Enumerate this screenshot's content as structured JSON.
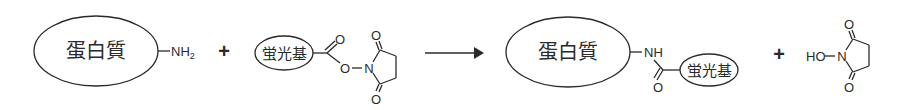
{
  "diagram": {
    "type": "chemical-reaction",
    "reactants": {
      "protein": {
        "label": "蛋白質",
        "group": "NH",
        "group_sub": "2"
      },
      "plus": "+",
      "fluorophore_ester": {
        "label": "蛋白質_placeholder_unused",
        "fluor_label": "蛍光基",
        "carbonyl_o": "O",
        "ester_o": "O",
        "n_atom": "N",
        "ring_o_top": "O",
        "ring_o_bottom": "O"
      }
    },
    "arrow": "→",
    "products": {
      "conjugate": {
        "protein_label": "蛋白質",
        "nh": "NH",
        "carbonyl_o": "O",
        "fluor_label": "蛍光基"
      },
      "plus": "+",
      "nhs": {
        "ho": "HO",
        "n_atom": "N",
        "ring_o_top": "O",
        "ring_o_bottom": "O"
      }
    }
  }
}
